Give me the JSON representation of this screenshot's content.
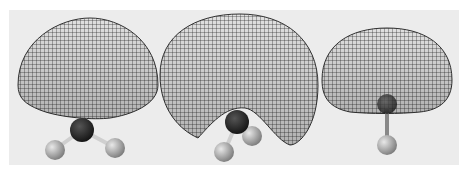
{
  "figure": {
    "background_color": "#ececec",
    "panels": [
      {
        "id": "left",
        "shape": "dome-lobe",
        "molecule": "trigonal (central atom with two visible H)"
      },
      {
        "id": "center",
        "shape": "curled-lobe",
        "molecule": "bent (central atom with two H)"
      },
      {
        "id": "right",
        "shape": "dome-lobe-with-cavity",
        "molecule": "diatomic (central atom with one H)"
      }
    ],
    "colors": {
      "mesh": "#2a2a2a",
      "central_atom": "#1a1a1a",
      "hydrogen_atom": "#b0b0b0"
    }
  }
}
